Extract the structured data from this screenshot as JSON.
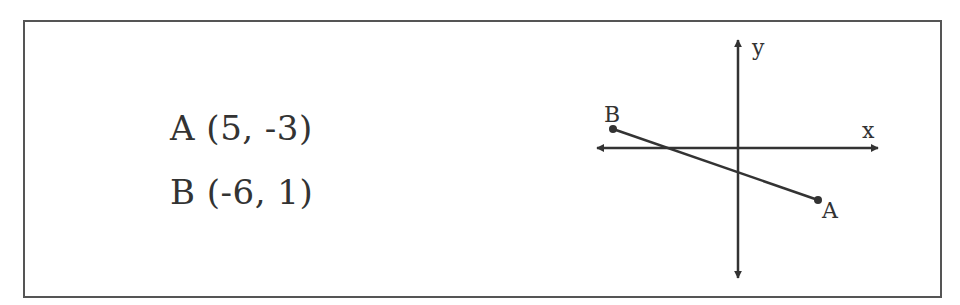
{
  "points": [
    {
      "name": "A",
      "coords": "(5, -3)",
      "label": "A (5, -3)"
    },
    {
      "name": "B",
      "coords": "(-6, 1)",
      "label": "B (-6, 1)"
    }
  ],
  "graph": {
    "x_axis_label": "x",
    "y_axis_label": "y",
    "point_a_label": "A",
    "point_b_label": "B",
    "line_color": "#333333"
  }
}
